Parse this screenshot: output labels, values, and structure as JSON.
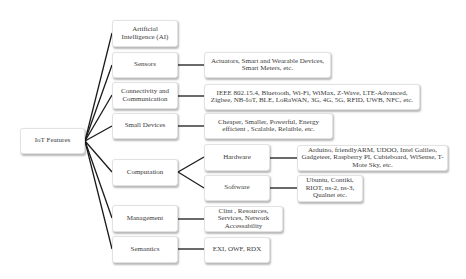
{
  "root": {
    "label": "IoT Features"
  },
  "level1": {
    "ai": "Artificial Intelligence (AI)",
    "sensors": "Sensors",
    "connectivity": "Connectivity and Communication",
    "small_devices": "Small Devices",
    "computation": "Computation",
    "management": "Management",
    "semantics": "Semantics"
  },
  "level2": {
    "sensors_detail": "Actuators, Smart and Wearable Devices, Smart Meters, etc.",
    "connectivity_detail": "IEEE 802.15.4, Bluetooth, Wi-Fi, WiMax, Z-Wave, LTE-Advanced, Zigbee,  NB-IoT, BLE, LoRaWAN, 3G, 4G, 5G, RFID, UWB,  NFC, etc.",
    "small_devices_detail": "Cheaper, Smaller, Powerful, Energy efficient , Scalable, Relaible, etc.",
    "hardware": "Hardware",
    "software": "Software",
    "management_detail": "Clint , Resources, Services,  Network Accessability",
    "semantics_detail": "EXI, OWF, RDX"
  },
  "level3": {
    "hardware_detail": "Arduino, friendlyARM, UDOO, Intel Galileo, Gadgeteer, Raspberry PI, Cubieboard, WiSense, T-Mote Sky, etc.",
    "software_detail": "Ubuntu, Contiki, RIOT, ns-2, ns-3, Qualnet etc."
  },
  "colors": {
    "connector": "#1a1a1a",
    "box_border": "#e2e2e2",
    "background": "#ffffff"
  }
}
